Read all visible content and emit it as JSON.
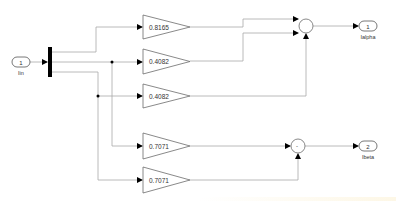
{
  "diagram": {
    "type": "simulink-block-diagram",
    "inports": [
      {
        "number": "1",
        "label": "Iin"
      }
    ],
    "outports": [
      {
        "number": "1",
        "label": "Ialpha"
      },
      {
        "number": "2",
        "label": "Ibeta"
      }
    ],
    "demux": {
      "outputs": 3
    },
    "gains": [
      {
        "id": "gain1",
        "value": "0.8165"
      },
      {
        "id": "gain2",
        "value": "0.4082"
      },
      {
        "id": "gain3",
        "value": "0.4082"
      },
      {
        "id": "gain4",
        "value": "0.7071"
      },
      {
        "id": "gain5",
        "value": "0.7071"
      }
    ],
    "sums": [
      {
        "id": "sum-alpha",
        "sign_text": "",
        "inputs": 3
      },
      {
        "id": "sum-beta",
        "sign_text": "-",
        "inputs": 2
      }
    ],
    "colors": {
      "line": "#a0a0a0",
      "block_border": "#6b6b6b",
      "demux": "#000000",
      "arrow": "#000000",
      "text": "#333333"
    }
  }
}
